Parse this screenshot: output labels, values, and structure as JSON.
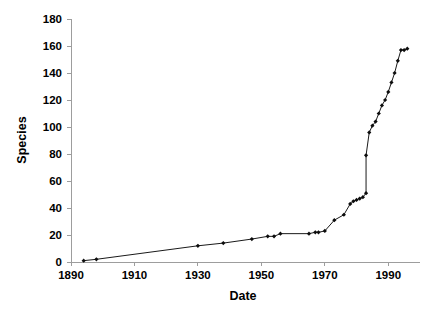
{
  "chart_data": {
    "type": "line",
    "title": "",
    "xlabel": "Date",
    "ylabel": "Species",
    "xlim": [
      1890,
      2000
    ],
    "ylim": [
      0,
      180
    ],
    "xticks": [
      1890,
      1910,
      1930,
      1950,
      1970,
      1990
    ],
    "xtick_labels": [
      "1890",
      "1910",
      "1930",
      "1950",
      "1970",
      "1990"
    ],
    "yticks": [
      0,
      20,
      40,
      60,
      80,
      100,
      120,
      140,
      160,
      180
    ],
    "ytick_labels": [
      "0",
      "20",
      "40",
      "60",
      "80",
      "100",
      "120",
      "140",
      "160",
      "180"
    ],
    "grid": false,
    "legend": null,
    "marker": "filled-diamond",
    "line_color": "#1a1a1a",
    "marker_color": "#0d0d0d",
    "axis_color": "#9d9d9d",
    "series": [
      {
        "name": "Cumulative species",
        "x": [
          1894,
          1898,
          1930,
          1938,
          1947,
          1952,
          1954,
          1956,
          1965,
          1967,
          1968,
          1970,
          1973,
          1976,
          1978,
          1979,
          1980,
          1981,
          1982,
          1983,
          1983,
          1984,
          1985,
          1986,
          1987,
          1988,
          1989,
          1990,
          1991,
          1992,
          1993,
          1994,
          1995,
          1996
        ],
        "y": [
          1,
          2,
          12,
          14,
          17,
          19,
          19,
          21,
          21,
          22,
          22,
          23,
          31,
          35,
          43,
          45,
          46,
          47,
          48,
          51,
          79,
          96,
          101,
          104,
          110,
          116,
          120,
          126,
          133,
          140,
          149,
          157,
          157,
          158
        ]
      }
    ]
  },
  "axis_titles": {
    "x": "Date",
    "y": "Species"
  }
}
